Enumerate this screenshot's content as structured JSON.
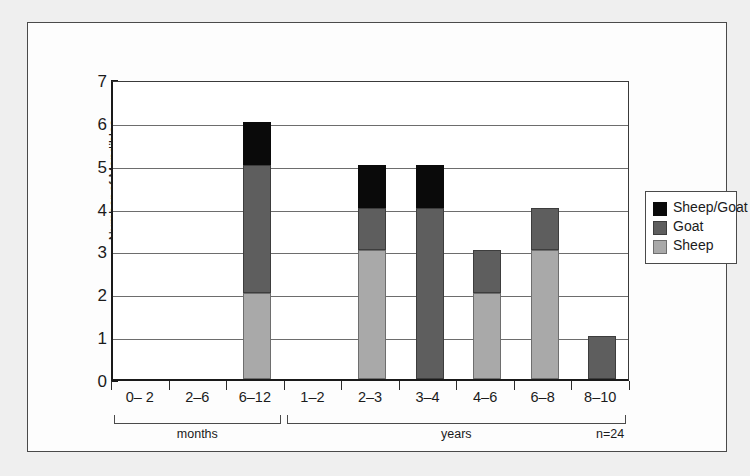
{
  "figure": {
    "note": "n=24"
  },
  "chart_data": {
    "type": "bar",
    "subtype": "stacked",
    "title": "",
    "xlabel": "",
    "ylabel": "Number of Mandibles",
    "ylim": [
      0,
      7
    ],
    "ytick_labels": [
      "0",
      "1",
      "2",
      "3",
      "4",
      "5",
      "6",
      "7"
    ],
    "grid": true,
    "legend_position": "right",
    "categories": [
      "0– 2",
      "2–6",
      "6–12",
      "1–2",
      "2–3",
      "3–4",
      "4–6",
      "6–8",
      "8–10"
    ],
    "group_labels": [
      "months",
      "years"
    ],
    "groups": [
      {
        "label": "months",
        "categories": [
          "0– 2",
          "2–6",
          "6–12"
        ]
      },
      {
        "label": "years",
        "categories": [
          "1–2",
          "2–3",
          "3–4",
          "4–6",
          "6–8",
          "8–10"
        ]
      }
    ],
    "series": [
      {
        "name": "Sheep",
        "color": "#a9a9a9",
        "values": [
          0,
          0,
          2,
          0,
          3,
          0,
          2,
          3,
          0
        ]
      },
      {
        "name": "Goat",
        "color": "#5e5e5e",
        "values": [
          0,
          0,
          3,
          0,
          1,
          4,
          1,
          1,
          1
        ]
      },
      {
        "name": "Sheep/Goat",
        "color": "#0a0a0a",
        "values": [
          0,
          0,
          1,
          0,
          1,
          1,
          0,
          0,
          0
        ]
      }
    ],
    "totals": [
      0,
      0,
      6,
      0,
      5,
      5,
      3,
      4,
      1
    ],
    "legend": [
      {
        "name": "Sheep/Goat",
        "color": "#0a0a0a"
      },
      {
        "name": "Goat",
        "color": "#5e5e5e"
      },
      {
        "name": "Sheep",
        "color": "#a9a9a9"
      }
    ]
  }
}
